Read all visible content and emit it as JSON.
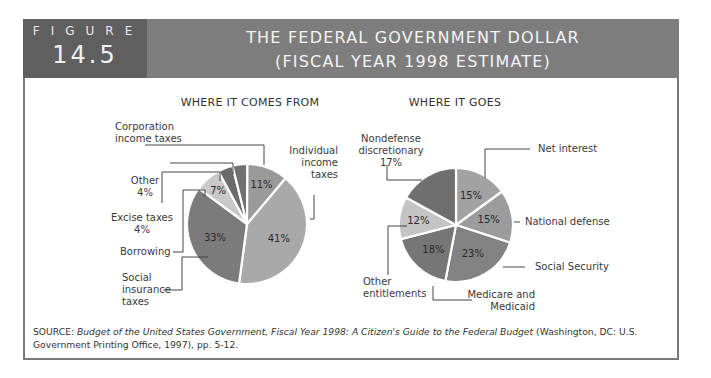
{
  "header": {
    "figure_word": "FIGURE",
    "figure_number": "14.5",
    "title_line1": "THE FEDERAL GOVERNMENT DOLLAR",
    "title_line2": "(FISCAL YEAR 1998 ESTIMATE)"
  },
  "left_chart": {
    "title": "WHERE IT COMES FROM",
    "labels": {
      "corporation": "Corporation\nincome taxes",
      "other": "Other\n4%",
      "excise": "Excise taxes\n4%",
      "borrowing": "Borrowing",
      "social": "Social\ninsurance\ntaxes",
      "individual": "Individual\nincome\ntaxes"
    }
  },
  "right_chart": {
    "title": "WHERE IT GOES",
    "labels": {
      "nondefense": "Nondefense\ndiscretionary\n17%",
      "net_interest": "Net interest",
      "national_defense": "National defense",
      "social_security": "Social Security",
      "medicare": "Medicare and\nMedicaid",
      "other_entitlements": "Other\nentitlements"
    }
  },
  "source": {
    "prefix": "SOURCE: ",
    "italic": "Budget of the United States Government, Fiscal Year 1998: A Citizen's Guide to the Federal Budget",
    "suffix": " (Washington, DC: U.S. Government Printing Office, 1997), pp. 5-12."
  },
  "chart_data": [
    {
      "type": "pie",
      "title": "WHERE IT COMES FROM",
      "categories": [
        "Individual income taxes",
        "Social insurance taxes",
        "Borrowing",
        "Excise taxes",
        "Other",
        "Corporation income taxes"
      ],
      "values": [
        41,
        33,
        7,
        4,
        4,
        11
      ],
      "value_labels": [
        "41%",
        "33%",
        "7%",
        "",
        "",
        "11%"
      ],
      "colors": [
        "#a9a9a9",
        "#7b7b7b",
        "#c9c9c9",
        "#6b6b6b",
        "#707070",
        "#9a9a9a"
      ]
    },
    {
      "type": "pie",
      "title": "WHERE IT GOES",
      "categories": [
        "Net interest",
        "National defense",
        "Social Security",
        "Medicare and Medicaid",
        "Other entitlements",
        "Nondefense discretionary"
      ],
      "values": [
        15,
        15,
        23,
        18,
        12,
        17
      ],
      "value_labels": [
        "15%",
        "15%",
        "23%",
        "18%",
        "12%",
        "17%"
      ],
      "colors": [
        "#a2a2a2",
        "#9c9c9c",
        "#828282",
        "#767676",
        "#c4c4c4",
        "#6f6f6f"
      ]
    }
  ]
}
